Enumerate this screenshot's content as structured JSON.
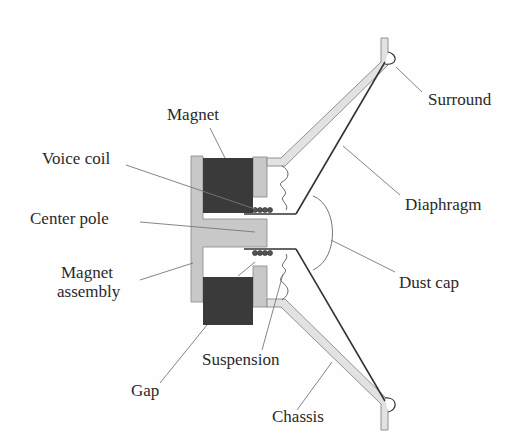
{
  "diagram": {
    "type": "loudspeaker cross-section",
    "colors": {
      "magnet": "#3a3a3a",
      "metal": "#c8c8c8",
      "line": "#333333",
      "leader": "#777777",
      "text": "#2a2a2a",
      "background": "#fefefe"
    },
    "labels": {
      "magnet": "Magnet",
      "voice_coil": "Voice coil",
      "center_pole": "Center pole",
      "magnet_assembly_line1": "Magnet",
      "magnet_assembly_line2": "assembly",
      "gap": "Gap",
      "suspension": "Suspension",
      "chassis": "Chassis",
      "surround": "Surround",
      "diaphragm": "Diaphragm",
      "dust_cap": "Dust cap"
    }
  }
}
